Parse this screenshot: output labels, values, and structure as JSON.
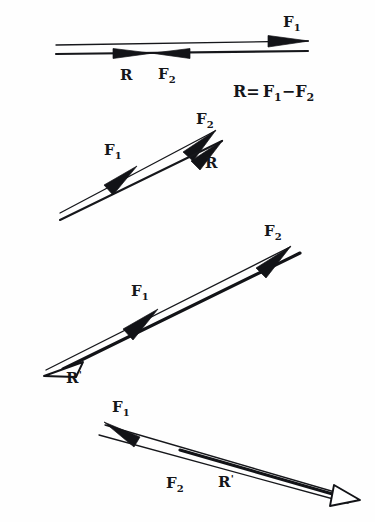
{
  "page": {
    "background_color": "#fefefe",
    "ink_color": "#15161a",
    "width": 375,
    "height": 522
  },
  "equation": {
    "text": "R= F₁−F₂",
    "lhs": "R",
    "equals": "=",
    "term1": "F",
    "term1_sub": "1",
    "minus": "−",
    "term2": "F",
    "term2_sub": "2"
  },
  "diagrams": [
    {
      "id": "diagram-1",
      "name": "collinear-opposing-forces",
      "orientation": "horizontal",
      "labels": [
        {
          "id": "d1-f1",
          "base": "F",
          "sub": "1",
          "text": "F₁",
          "x": 283,
          "y": 27
        },
        {
          "id": "d1-r",
          "base": "R",
          "sub": "",
          "text": "R",
          "x": 120,
          "y": 80
        },
        {
          "id": "d1-f2",
          "base": "F",
          "sub": "2",
          "text": "F₂",
          "x": 158,
          "y": 79
        }
      ]
    },
    {
      "id": "diagram-2",
      "name": "same-direction-short-resultant",
      "orientation": "diagonal-up-right",
      "labels": [
        {
          "id": "d2-f2",
          "base": "F",
          "sub": "2",
          "text": "F₂",
          "x": 196,
          "y": 124
        },
        {
          "id": "d2-f1",
          "base": "F",
          "sub": "1",
          "text": "F₁",
          "x": 104,
          "y": 155
        },
        {
          "id": "d2-r",
          "base": "R",
          "sub": "",
          "text": "R",
          "x": 205,
          "y": 168
        }
      ]
    },
    {
      "id": "diagram-3",
      "name": "opposed-resultant-reversed",
      "orientation": "diagonal-up-right",
      "labels": [
        {
          "id": "d3-f2",
          "base": "F",
          "sub": "2",
          "text": "F₂",
          "x": 264,
          "y": 236
        },
        {
          "id": "d3-f1",
          "base": "F",
          "sub": "1",
          "text": "F₁",
          "x": 131,
          "y": 296
        },
        {
          "id": "d3-rprime",
          "base": "R",
          "sub": "",
          "prime": "'",
          "text": "R'",
          "x": 66,
          "y": 383
        }
      ]
    },
    {
      "id": "diagram-4",
      "name": "reversed-f1-resultant-down-right",
      "orientation": "diagonal-down-right",
      "labels": [
        {
          "id": "d4-f1",
          "base": "F",
          "sub": "1",
          "text": "F₁",
          "x": 112,
          "y": 412
        },
        {
          "id": "d4-f2",
          "base": "F",
          "sub": "2",
          "text": "F₂",
          "x": 166,
          "y": 488
        },
        {
          "id": "d4-rprime",
          "base": "R",
          "sub": "",
          "prime": "'",
          "text": "R'",
          "x": 218,
          "y": 487
        }
      ]
    }
  ]
}
